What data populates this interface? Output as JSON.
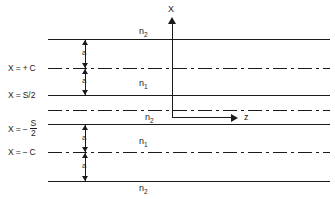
{
  "figure": {
    "type": "layered-waveguide-cross-section",
    "axes": {
      "vertical_label": "X",
      "horizontal_label": "z"
    },
    "boundary_labels": [
      {
        "id": "x-plus-c",
        "text": "X = + C",
        "parts": {
          "var": "X",
          "eq": "=",
          "sign": "+",
          "value": "C"
        }
      },
      {
        "id": "x-s-over-2",
        "text": "X = S/2",
        "parts": {
          "var": "X",
          "eq": "=",
          "sign": "",
          "value": "S/2"
        }
      },
      {
        "id": "x-minus-s-over-2",
        "text": "X = - S/2",
        "parts": {
          "var": "X",
          "eq": "=",
          "sign": "−",
          "numerator": "S",
          "denominator": "2"
        }
      },
      {
        "id": "x-minus-c",
        "text": "X = - C",
        "parts": {
          "var": "X",
          "eq": "=",
          "sign": "−",
          "value": "C"
        }
      }
    ],
    "region_labels": [
      {
        "id": "top-cladding",
        "base": "n",
        "sub": "2"
      },
      {
        "id": "upper-guide",
        "base": "n",
        "sub": "1"
      },
      {
        "id": "center-layer",
        "base": "n",
        "sub": "2"
      },
      {
        "id": "lower-guide",
        "base": "n",
        "sub": "1"
      },
      {
        "id": "bottom-cladding",
        "base": "n",
        "sub": "2"
      }
    ],
    "dimension_labels": [
      {
        "id": "a-upper-outer",
        "text": "a"
      },
      {
        "id": "a-upper-inner",
        "text": "a"
      },
      {
        "id": "a-lower-inner",
        "text": "a"
      },
      {
        "id": "a-lower-outer",
        "text": "a"
      }
    ],
    "colors": {
      "line": "#1a1a1a",
      "background": "#ffffff"
    }
  }
}
